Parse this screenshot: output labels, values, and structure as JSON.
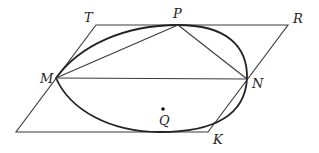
{
  "diagram": {
    "type": "geometry",
    "points": {
      "T": {
        "label": "T"
      },
      "P": {
        "label": "P"
      },
      "R": {
        "label": "R"
      },
      "M": {
        "label": "M"
      },
      "N": {
        "label": "N"
      },
      "Q": {
        "label": "Q"
      },
      "K": {
        "label": "K"
      }
    },
    "colors": {
      "line": "#3a3a3a",
      "curve": "#222222",
      "background": "#ffffff"
    }
  }
}
